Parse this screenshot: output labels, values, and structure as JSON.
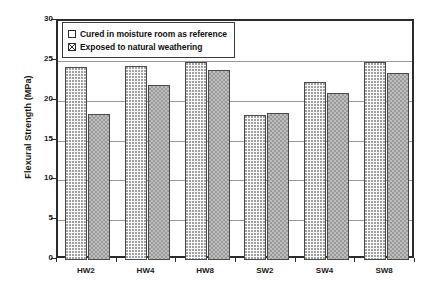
{
  "chart_data": {
    "type": "bar",
    "title": "",
    "xlabel": "",
    "ylabel": "Flexural Strength (MPa)",
    "categories": [
      "HW2",
      "HW4",
      "HW8",
      "SW2",
      "SW4",
      "SW8"
    ],
    "series": [
      {
        "name": "Cured in moisture room as reference",
        "values": [
          24.2,
          24.3,
          24.9,
          18.2,
          22.3,
          24.9
        ],
        "fill": "light-dotted",
        "swatch": "empty-square"
      },
      {
        "name": "Exposed to natural weathering",
        "values": [
          18.3,
          22.0,
          23.9,
          18.5,
          21.0,
          23.5
        ],
        "fill": "gray-checkered",
        "swatch": "crossed-square"
      }
    ],
    "ylim": [
      0,
      30
    ],
    "yticks": [
      0,
      5,
      10,
      15,
      20,
      25,
      30
    ],
    "ytick_labels": [
      "0",
      "5",
      "10",
      "15",
      "20",
      "25",
      "30"
    ],
    "grid": true,
    "grid_axis": "y",
    "legend_position": "top-left-inside",
    "frame_color": "#2b2b2b",
    "grid_color": "#9a9a9a"
  }
}
